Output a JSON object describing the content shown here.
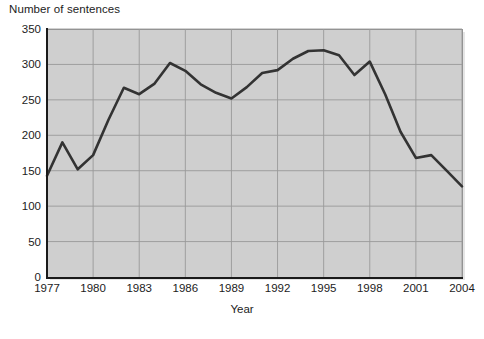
{
  "chart_data": {
    "type": "line",
    "title": "",
    "ylabel": "Number of sentences",
    "xlabel": "Year",
    "x": [
      1977,
      1978,
      1979,
      1980,
      1981,
      1982,
      1983,
      1984,
      1985,
      1986,
      1987,
      1988,
      1989,
      1990,
      1991,
      1992,
      1993,
      1994,
      1995,
      1996,
      1997,
      1998,
      1999,
      2000,
      2001,
      2002,
      2003,
      2004
    ],
    "values": [
      143,
      190,
      152,
      172,
      222,
      267,
      258,
      273,
      302,
      291,
      272,
      260,
      252,
      268,
      288,
      292,
      308,
      319,
      320,
      313,
      285,
      304,
      258,
      205,
      168,
      172,
      150,
      128
    ],
    "series": [
      {
        "name": "Number of sentences",
        "values": [
          143,
          190,
          152,
          172,
          222,
          267,
          258,
          273,
          302,
          291,
          272,
          260,
          252,
          268,
          288,
          292,
          308,
          319,
          320,
          313,
          285,
          304,
          258,
          205,
          168,
          172,
          150,
          128
        ],
        "color": "#333333"
      }
    ],
    "xlim": [
      1977,
      2004
    ],
    "ylim": [
      0,
      350
    ],
    "y_ticks": [
      0,
      50,
      100,
      150,
      200,
      250,
      300,
      350
    ],
    "y_tick_labels": [
      "0",
      "50",
      "100",
      "150",
      "200",
      "250",
      "300",
      "350"
    ],
    "x_ticks": [
      1977,
      1980,
      1983,
      1986,
      1989,
      1992,
      1995,
      1998,
      2001,
      2004
    ],
    "x_tick_labels": [
      "1977",
      "1980",
      "1983",
      "1986",
      "1989",
      "1992",
      "1995",
      "1998",
      "2001",
      "2004"
    ],
    "grid": true,
    "legend": "none",
    "plot_background_color": "#cfcfcf",
    "grid_color": "#9a9a9a",
    "line_color": "#333333",
    "axis_color": "#1a1a1a",
    "page_background_color": "#ffffff"
  }
}
